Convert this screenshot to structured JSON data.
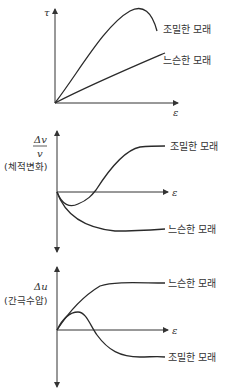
{
  "diagram": {
    "colors": {
      "line": "#2a2a2a",
      "text": "#333333",
      "background": "#ffffff"
    },
    "panels": [
      {
        "id": "shear-stress",
        "y_label": "τ",
        "x_label": "ε",
        "curves": [
          {
            "label": "조밀한 모래",
            "behavior": "rises to peak then falls"
          },
          {
            "label": "느슨한 모래",
            "behavior": "rises steadily"
          }
        ]
      },
      {
        "id": "volume-change",
        "y_label_num": "Δv",
        "y_label_den": "v",
        "y_label_desc": "(체적변화)",
        "x_label": "ε",
        "curves": [
          {
            "label": "조밀한 모래",
            "behavior": "small contraction then dilation to plateau"
          },
          {
            "label": "느슨한 모래",
            "behavior": "contraction to negative plateau"
          }
        ]
      },
      {
        "id": "pore-pressure",
        "y_label": "Δu",
        "y_label_desc": "(간극수압)",
        "x_label": "ε",
        "curves": [
          {
            "label": "느슨한 모래",
            "behavior": "rises to positive plateau"
          },
          {
            "label": "조밀한 모래",
            "behavior": "small positive peak then negative plateau"
          }
        ]
      }
    ]
  }
}
